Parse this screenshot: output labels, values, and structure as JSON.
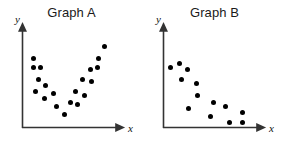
{
  "figure": {
    "background_color": "#ffffff",
    "axis_color": "#333333",
    "point_color": "#000000",
    "title_color": "#1a1a1a"
  },
  "chart_data": [
    {
      "type": "scatter",
      "title": "Graph A",
      "xlabel": "x",
      "ylabel": "y",
      "grid": false,
      "legend": null,
      "xlim": [
        0,
        100
      ],
      "ylim": [
        0,
        100
      ],
      "description": "U-shaped (non-linear) scatter: values decrease then increase",
      "points": [
        {
          "x": 12,
          "y": 72
        },
        {
          "x": 12,
          "y": 62
        },
        {
          "x": 20,
          "y": 62
        },
        {
          "x": 18,
          "y": 50
        },
        {
          "x": 15,
          "y": 38
        },
        {
          "x": 26,
          "y": 44
        },
        {
          "x": 24,
          "y": 30
        },
        {
          "x": 34,
          "y": 36
        },
        {
          "x": 38,
          "y": 22
        },
        {
          "x": 46,
          "y": 14
        },
        {
          "x": 53,
          "y": 26
        },
        {
          "x": 60,
          "y": 24
        },
        {
          "x": 58,
          "y": 38
        },
        {
          "x": 68,
          "y": 34
        },
        {
          "x": 66,
          "y": 50
        },
        {
          "x": 76,
          "y": 48
        },
        {
          "x": 74,
          "y": 60
        },
        {
          "x": 82,
          "y": 62
        },
        {
          "x": 83,
          "y": 72
        },
        {
          "x": 90,
          "y": 84
        }
      ]
    },
    {
      "type": "scatter",
      "title": "Graph B",
      "xlabel": "x",
      "ylabel": "y",
      "grid": false,
      "legend": null,
      "xlim": [
        0,
        100
      ],
      "ylim": [
        0,
        100
      ],
      "description": "Negative linear association: values decrease as x increases",
      "points": [
        {
          "x": 8,
          "y": 62
        },
        {
          "x": 18,
          "y": 66
        },
        {
          "x": 27,
          "y": 60
        },
        {
          "x": 20,
          "y": 50
        },
        {
          "x": 36,
          "y": 46
        },
        {
          "x": 38,
          "y": 34
        },
        {
          "x": 28,
          "y": 20
        },
        {
          "x": 55,
          "y": 26
        },
        {
          "x": 52,
          "y": 12
        },
        {
          "x": 68,
          "y": 22
        },
        {
          "x": 72,
          "y": 6
        },
        {
          "x": 86,
          "y": 16
        },
        {
          "x": 86,
          "y": 6
        }
      ]
    }
  ]
}
